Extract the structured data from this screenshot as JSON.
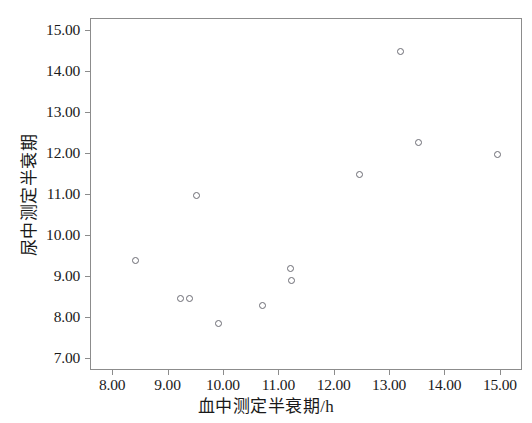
{
  "chart_data": {
    "type": "scatter",
    "title": "",
    "xlabel": "血中测定半衰期/h",
    "ylabel": "尿中测定半衰期",
    "xlim": [
      7.6,
      15.4
    ],
    "ylim": [
      6.7,
      15.3
    ],
    "xticks": [
      "8.00",
      "9.00",
      "10.00",
      "11.00",
      "12.00",
      "13.00",
      "14.00",
      "15.00"
    ],
    "xtick_values": [
      8,
      9,
      10,
      11,
      12,
      13,
      14,
      15
    ],
    "yticks": [
      "7.00",
      "8.00",
      "9.00",
      "10.00",
      "11.00",
      "12.00",
      "13.00",
      "14.00",
      "15.00"
    ],
    "ytick_values": [
      7,
      8,
      9,
      10,
      11,
      12,
      13,
      14,
      15
    ],
    "grid": false,
    "legend": null,
    "marker": "open-circle",
    "marker_color": "#6b6b73",
    "frame_color": "#8c8c8c",
    "x": [
      8.4,
      9.22,
      9.38,
      9.5,
      9.91,
      10.7,
      11.2,
      11.22,
      12.44,
      13.19,
      13.52,
      14.94
    ],
    "y": [
      9.4,
      8.48,
      8.48,
      10.98,
      7.86,
      8.3,
      9.2,
      8.9,
      11.5,
      14.5,
      12.28,
      12.0
    ],
    "points": [
      {
        "x": 8.4,
        "y": 9.4
      },
      {
        "x": 9.22,
        "y": 8.48
      },
      {
        "x": 9.38,
        "y": 8.48
      },
      {
        "x": 9.5,
        "y": 10.98
      },
      {
        "x": 9.91,
        "y": 7.86
      },
      {
        "x": 10.7,
        "y": 8.3
      },
      {
        "x": 11.2,
        "y": 9.2
      },
      {
        "x": 11.22,
        "y": 8.9
      },
      {
        "x": 12.44,
        "y": 11.5
      },
      {
        "x": 13.19,
        "y": 14.5
      },
      {
        "x": 13.52,
        "y": 12.28
      },
      {
        "x": 14.94,
        "y": 12.0
      }
    ]
  }
}
